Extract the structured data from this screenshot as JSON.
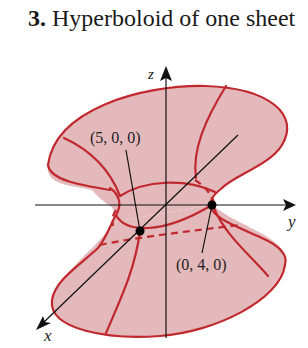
{
  "title": {
    "number": "3.",
    "text": "Hyperboloid of one sheet"
  },
  "figure": {
    "surface": "hyperboloid of one sheet",
    "colors": {
      "fill": "#e3b9bb",
      "curve": "#c0282e",
      "axis": "#111111"
    },
    "axes": {
      "x_label": "x",
      "y_label": "y",
      "z_label": "z"
    },
    "points": [
      {
        "label": "(5, 0, 0)",
        "axis": "x"
      },
      {
        "label": "(0, 4, 0)",
        "axis": "y"
      }
    ]
  }
}
